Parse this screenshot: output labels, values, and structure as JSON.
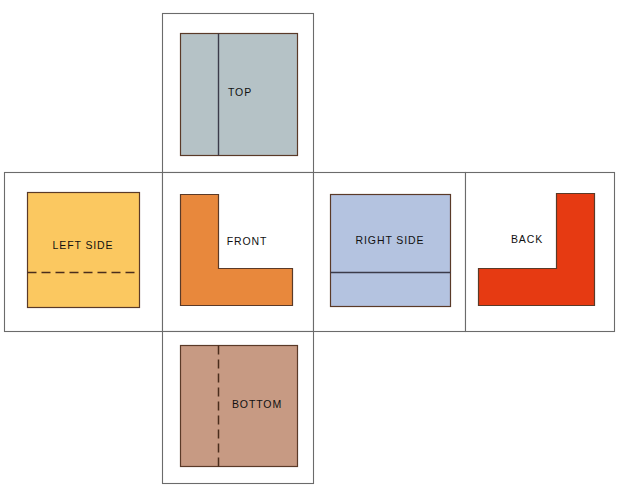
{
  "diagram": {
    "type": "orthographic-projection-unfolding",
    "canvas": {
      "width": 627,
      "height": 494,
      "background": "#ffffff"
    },
    "line_colors": {
      "frame": "#6b6b6b",
      "object_outline": "#5a3a28",
      "visible_edge": "#3b3b4a",
      "hidden_edge": "#4a2d1c"
    },
    "views": [
      {
        "id": "top",
        "label": "TOP",
        "fill": "#b5c2c6",
        "label_x": 240,
        "label_y": 93,
        "frame": {
          "x": 162,
          "y": 13,
          "width": 151,
          "height": 159
        },
        "shape_kind": "rectangle",
        "shape": {
          "x": 180,
          "y": 33,
          "width": 117,
          "height": 122
        },
        "edge_kind": "visible",
        "edge_orientation": "vertical",
        "edge_position": 218
      },
      {
        "id": "left-side",
        "label": "LEFT SIDE",
        "fill": "#fbc860",
        "label_x": 83,
        "label_y": 246,
        "frame": {
          "x": 4,
          "y": 172,
          "width": 158,
          "height": 159
        },
        "shape_kind": "rectangle",
        "shape": {
          "x": 27,
          "y": 192,
          "width": 112,
          "height": 115
        },
        "edge_kind": "hidden",
        "edge_orientation": "horizontal",
        "edge_position": 272
      },
      {
        "id": "front",
        "label": "FRONT",
        "fill": "#e8883c",
        "label_x": 247,
        "label_y": 242,
        "frame": {
          "x": 162,
          "y": 172,
          "width": 151,
          "height": 159
        },
        "shape_kind": "ell",
        "shape": {
          "x": 180,
          "y": 194,
          "width": 112,
          "height": 111
        },
        "arm_width": 38,
        "foot_height": 37,
        "mirrored": false,
        "edge_kind": "none"
      },
      {
        "id": "right-side",
        "label": "RIGHT SIDE",
        "fill": "#b4c3e0",
        "label_x": 390,
        "label_y": 241,
        "frame": {
          "x": 313,
          "y": 172,
          "width": 152,
          "height": 159
        },
        "shape_kind": "rectangle",
        "shape": {
          "x": 330,
          "y": 194,
          "width": 120,
          "height": 112
        },
        "edge_kind": "visible",
        "edge_orientation": "horizontal",
        "edge_position": 272
      },
      {
        "id": "back",
        "label": "BACK",
        "fill": "#e63a12",
        "label_x": 527,
        "label_y": 240,
        "frame": {
          "x": 465,
          "y": 172,
          "width": 149,
          "height": 159
        },
        "shape_kind": "ell",
        "shape": {
          "x": 478,
          "y": 193,
          "width": 116,
          "height": 112
        },
        "arm_width": 38,
        "foot_height": 37,
        "mirrored": true,
        "edge_kind": "none"
      },
      {
        "id": "bottom",
        "label": "BOTTOM",
        "fill": "#c79a83",
        "label_x": 257,
        "label_y": 405,
        "frame": {
          "x": 162,
          "y": 331,
          "width": 151,
          "height": 152
        },
        "shape_kind": "rectangle",
        "shape": {
          "x": 180,
          "y": 345,
          "width": 117,
          "height": 121
        },
        "edge_kind": "hidden",
        "edge_orientation": "vertical",
        "edge_position": 218
      }
    ]
  }
}
